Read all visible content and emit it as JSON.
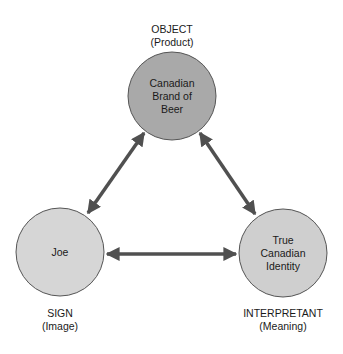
{
  "diagram": {
    "type": "semiotic-triangle",
    "colors": {
      "object_fill": "#a9a9a9",
      "sign_fill": "#d6d6d6",
      "interpretant_fill": "#cfcfcf",
      "stroke": "#555555",
      "arrow": "#505050"
    },
    "nodes": {
      "object": {
        "role_label": "OBJECT",
        "role_sub": "(Product)",
        "text_lines": [
          "Canadian",
          "Brand of",
          "Beer"
        ]
      },
      "sign": {
        "role_label": "SIGN",
        "role_sub": "(Image)",
        "text_lines": [
          "Joe"
        ]
      },
      "interpretant": {
        "role_label": "INTERPRETANT",
        "role_sub": "(Meaning)",
        "text_lines": [
          "True",
          "Canadian",
          "Identity"
        ]
      }
    },
    "edges": [
      {
        "from": "object",
        "to": "sign",
        "bidirectional": true
      },
      {
        "from": "object",
        "to": "interpretant",
        "bidirectional": true
      },
      {
        "from": "sign",
        "to": "interpretant",
        "bidirectional": true
      }
    ]
  }
}
